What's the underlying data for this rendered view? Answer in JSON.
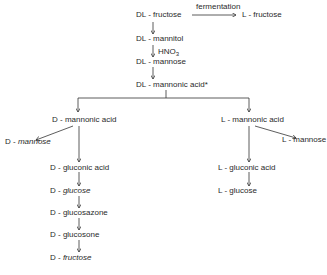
{
  "diagram": {
    "title_chain": {
      "dl_fructose": "DL - fructose",
      "fermentation_label": "fermentation",
      "l_fructose": "L - fructose",
      "dl_mannitol": "DL - mannitol",
      "reagent": "HNO",
      "reagent_sub": "3",
      "dl_mannose": "DL - mannose",
      "dl_mannonic_acid": "DL - mannonic acid*"
    },
    "d_branch": {
      "prefix": "D - ",
      "mannonic_acid": "D - mannonic acid",
      "mannose_prefix": "D - ",
      "mannose": "mannose",
      "gluconic_acid": "D - gluconic acid",
      "glucose_prefix": "D - ",
      "glucose": "glucose",
      "glucosazone": "D - glucosazone",
      "glucosone": "D - glucosone",
      "fructose_prefix": "D - ",
      "fructose": "fructose"
    },
    "l_branch": {
      "mannonic_acid": "L - mannonic acid",
      "mannose": "L - mannose",
      "gluconic_acid": "L - gluconic acid",
      "glucose": "L - glucose"
    }
  }
}
